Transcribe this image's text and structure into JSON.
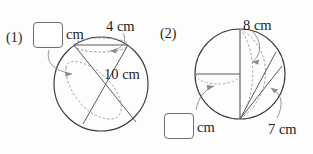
{
  "page": {
    "background_color": "#fdfdfd",
    "ink_color": "#1d1d1f",
    "solid_stroke_color": "#3a3a3c",
    "dashed_stroke_color": "#8e8e93",
    "leader_stroke_color": "#8a8a8e",
    "box_border_color": "#6f6f73",
    "width": 313,
    "height": 154
  },
  "problems": [
    {
      "number": "(1)",
      "answer_box": {
        "value": "",
        "unit": "cm"
      },
      "dimensions": [
        {
          "label": "4 cm",
          "value": 4,
          "unit": "cm"
        },
        {
          "label": "10 cm",
          "value": 10,
          "unit": "cm"
        }
      ],
      "shape": {
        "type": "sphere-with-cross-sections",
        "circle": {
          "cx": 101,
          "cy": 84,
          "r": 47
        }
      }
    },
    {
      "number": "(2)",
      "answer_box": {
        "value": "",
        "unit": "cm"
      },
      "dimensions": [
        {
          "label": "8 cm",
          "value": 8,
          "unit": "cm"
        },
        {
          "label": "7 cm",
          "value": 7,
          "unit": "cm"
        }
      ],
      "shape": {
        "type": "sphere-with-cross-sections",
        "circle": {
          "cx": 240,
          "cy": 74,
          "r": 45
        }
      }
    }
  ],
  "labels": {
    "p1_number": "(1)",
    "p1_unit": "cm",
    "p1_dim_a": "4 cm",
    "p1_dim_b": "10 cm",
    "p2_number": "(2)",
    "p2_unit": "cm",
    "p2_dim_a": "8 cm",
    "p2_dim_b": "7 cm"
  }
}
